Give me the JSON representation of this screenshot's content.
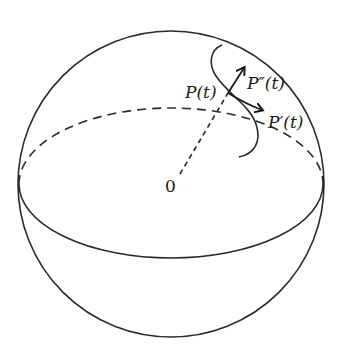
{
  "diagram": {
    "labels": {
      "origin": "0",
      "point": "P(t)",
      "first_derivative": "P′(t)",
      "second_derivative": "P″(t)"
    },
    "colors": {
      "stroke": "#2a2a2a",
      "background": "#ffffff"
    }
  }
}
